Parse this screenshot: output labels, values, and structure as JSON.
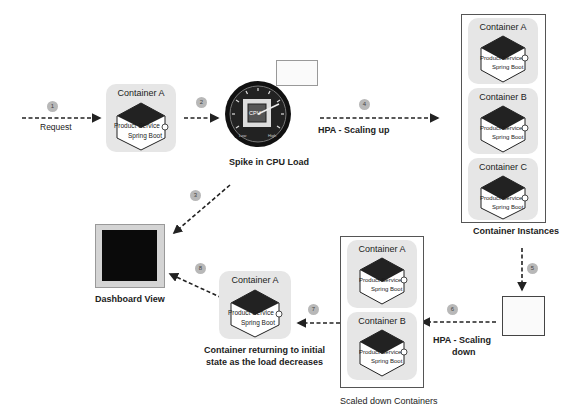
{
  "steps": [
    "1",
    "2",
    "3",
    "4",
    "5",
    "6",
    "7",
    "8"
  ],
  "labels": {
    "request": "Request",
    "spike": "Spike in CPU Load",
    "hpa_up": "HPA - Scaling up",
    "container_instances": "Container Instances",
    "dashboard": "Dashboard View",
    "hpa_down_1": "HPA - Scaling",
    "hpa_down_2": "down",
    "scaled_down": "Scaled down Containers",
    "returning_1": "Container returning to initial",
    "returning_2": "state as the load decreases"
  },
  "service": {
    "line1": "Product Service",
    "line2": "Spring Boot"
  },
  "cpu_gauge": {
    "chip_label": "CPU",
    "low": "Low",
    "high": "High"
  },
  "containers": {
    "initial": "Container A",
    "instances": [
      "Container A",
      "Container B",
      "Container C"
    ],
    "scaled_down": [
      "Container A",
      "Container B"
    ],
    "returned": "Container A"
  },
  "colors": {
    "card": "#e6e6e6",
    "hex_top": "#222222",
    "step_badge": "#b8b8b8",
    "dashboard": "#0a0a0a"
  }
}
